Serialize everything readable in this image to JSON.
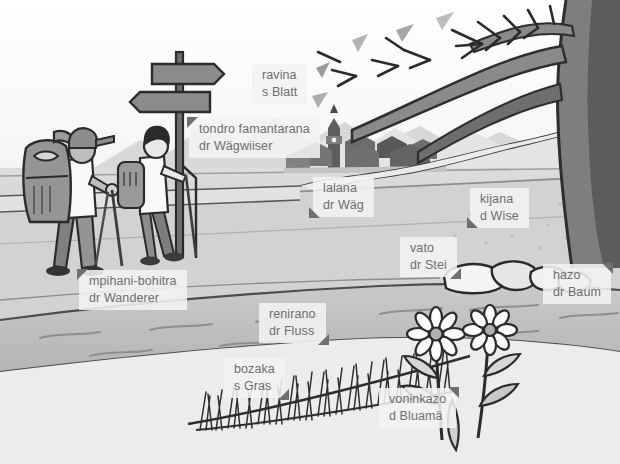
{
  "scene": {
    "title": "Hiking landscape picture-dictionary scene",
    "description": "Grayscale cartoon illustration of two hikers with backpacks and trekking poles walking a path past a signpost, a village with a church tower, a river with stones, grass, flowers and a large tree.",
    "background_color": "#ffffff",
    "label_background": "#f3f3f3",
    "label_text_color": "#6e6e6e",
    "pointer_color": "#6f6f6f"
  },
  "labels": [
    {
      "id": "ravina",
      "name": "leaf",
      "line1": "ravina",
      "line2": "s Blatt",
      "x": 252,
      "y": 64,
      "pointer": "none"
    },
    {
      "id": "tondro-famantarana",
      "name": "signpost",
      "line1": "tondro famantarana",
      "line2": "dr Wägwiiser",
      "x": 189,
      "y": 118,
      "pointer": "top-left"
    },
    {
      "id": "lalana",
      "name": "road",
      "line1": "lalana",
      "line2": "dr Wäg",
      "x": 313,
      "y": 177,
      "pointer": "bottom-left"
    },
    {
      "id": "kijana",
      "name": "meadow",
      "line1": "kijana",
      "line2": "d Wise",
      "x": 470,
      "y": 188,
      "pointer": "bottom-left"
    },
    {
      "id": "vato",
      "name": "stone",
      "line1": "vato",
      "line2": "dr Stei",
      "x": 400,
      "y": 237,
      "pointer": "bottom-right"
    },
    {
      "id": "hazo",
      "name": "tree",
      "line1": "hazo",
      "line2": "dr Baum",
      "x": 543,
      "y": 264,
      "pointer": "top-right"
    },
    {
      "id": "mpihani-bohitra",
      "name": "hiker",
      "line1": "mpihani-bohitra",
      "line2": "dr Wanderer",
      "x": 79,
      "y": 270,
      "pointer": "top-left"
    },
    {
      "id": "renirano",
      "name": "river",
      "line1": "renirano",
      "line2": "dr Fluss",
      "x": 259,
      "y": 303,
      "pointer": "bottom-right"
    },
    {
      "id": "bozaka",
      "name": "grass",
      "line1": "bozaka",
      "line2": "s Gras",
      "x": 224,
      "y": 358,
      "pointer": "bottom-right"
    },
    {
      "id": "voninkazo",
      "name": "flower",
      "line1": "voninkazo",
      "line2": "d Bluamä",
      "x": 379,
      "y": 388,
      "pointer": "top-right"
    }
  ],
  "artwork_parts": [
    {
      "id": "sky",
      "name": "sky"
    },
    {
      "id": "mountains",
      "name": "mountain-range"
    },
    {
      "id": "village",
      "name": "village-with-church"
    },
    {
      "id": "meadow",
      "name": "meadow-field"
    },
    {
      "id": "path",
      "name": "winding-path"
    },
    {
      "id": "tree",
      "name": "large-tree"
    },
    {
      "id": "hiker-front",
      "name": "hiker-with-large-backpack"
    },
    {
      "id": "hiker-back",
      "name": "hiker-with-small-backpack"
    },
    {
      "id": "signpost",
      "name": "signpost-two-arrows"
    },
    {
      "id": "river",
      "name": "river"
    },
    {
      "id": "stones",
      "name": "river-stones"
    },
    {
      "id": "grass",
      "name": "tall-grass-tufts"
    },
    {
      "id": "flowers",
      "name": "two-daisy-flowers"
    }
  ]
}
